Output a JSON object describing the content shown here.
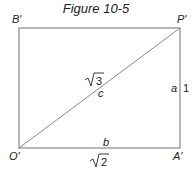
{
  "title": "Figure 10-5",
  "vertices": {
    "top_left": "B'",
    "top_right": "P'",
    "bottom_left": "O'",
    "bottom_right": "A'"
  },
  "edges": {
    "diagonal_label": "c",
    "diagonal_value": "3",
    "bottom_label": "b",
    "bottom_value": "2",
    "right_label": "a",
    "right_value": "1"
  },
  "colors": {
    "line": "#888888",
    "text": "#222222"
  }
}
